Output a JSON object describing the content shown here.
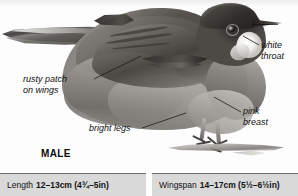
{
  "plate": {
    "subject": "male warbler side view perched on twig",
    "caption": "MALE",
    "annotations": [
      {
        "id": "white-throat",
        "text": "white\nthroat"
      },
      {
        "id": "rusty-patch",
        "text": "rusty patch\non wings"
      },
      {
        "id": "pink-breast",
        "text": "pink\nbreast"
      },
      {
        "id": "bright-legs",
        "text": "bright legs"
      }
    ]
  },
  "measurements": {
    "length": {
      "label": "Length",
      "value": "12–13cm (4¾–5in)"
    },
    "wingspan": {
      "label": "Wingspan",
      "value": "14–17cm (5½–6½in)"
    }
  },
  "colors": {
    "page_background": "#fdfdfd",
    "table_cell": "#d9d9d9",
    "table_border": "#6d6d6d",
    "text": "#111111"
  }
}
